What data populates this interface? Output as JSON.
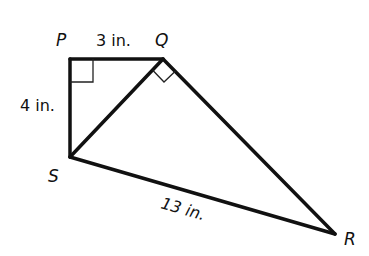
{
  "diagram": {
    "type": "geometry",
    "shape": "quadrilateral PQRS with diagonal QS",
    "vertices": {
      "P": {
        "label": "P",
        "x": 70,
        "y": 59
      },
      "Q": {
        "label": "Q",
        "x": 163,
        "y": 59
      },
      "S": {
        "label": "S",
        "x": 70,
        "y": 157
      },
      "R": {
        "label": "R",
        "x": 335,
        "y": 234
      }
    },
    "segments": [
      {
        "from": "P",
        "to": "Q",
        "length_label": "3 in."
      },
      {
        "from": "P",
        "to": "S",
        "length_label": "4 in."
      },
      {
        "from": "S",
        "to": "R",
        "length_label": "13 in."
      },
      {
        "from": "Q",
        "to": "R",
        "length_label": ""
      },
      {
        "from": "Q",
        "to": "S",
        "length_label": ""
      }
    ],
    "right_angles": [
      "P",
      "Q (angle SQR)"
    ],
    "labels": {
      "P": "P",
      "Q": "Q",
      "S": "S",
      "R": "R",
      "PQ": "3 in.",
      "PS": "4 in.",
      "SR": "13 in."
    },
    "stroke_color": "#111111"
  }
}
